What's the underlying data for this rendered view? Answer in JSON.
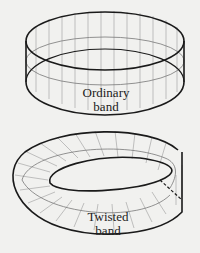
{
  "figures": [
    {
      "id": "ordinary",
      "label_line1": "Ordinary",
      "label_line2": "band"
    },
    {
      "id": "twisted",
      "label_line1": "Twisted",
      "label_line2": "band"
    }
  ],
  "colors": {
    "background": "#f1f1ef",
    "stroke": "#1a1a1a",
    "grid": "#9a9a9a"
  }
}
